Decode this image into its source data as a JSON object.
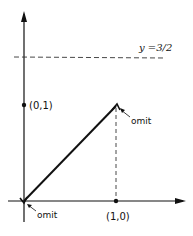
{
  "diagram": {
    "type": "function-graph",
    "axes": {
      "x_axis": {
        "origin_px": [
          24,
          201
        ],
        "end_px": [
          185,
          201
        ]
      },
      "y_axis": {
        "origin_px": [
          24,
          222
        ],
        "end_px": [
          24,
          12
        ]
      }
    },
    "points": [
      {
        "id": "p01",
        "label": "(0,1)",
        "px": [
          24,
          105
        ],
        "filled": true
      },
      {
        "id": "p10",
        "label": "(1,0)",
        "px": [
          116,
          201
        ],
        "filled": true
      }
    ],
    "segment": {
      "from_px": [
        24,
        201
      ],
      "to_px": [
        116,
        105
      ],
      "description": "line y = x from (0,0) to (1,1), endpoints omitted"
    },
    "dashed_horizontal": {
      "label": "y =3/2",
      "y_px": 57,
      "x_from_px": 14,
      "x_to_px": 166
    },
    "dashed_vertical": {
      "x_px": 116,
      "y_from_px": 107,
      "y_to_px": 199
    },
    "annotations": [
      {
        "id": "omit-top",
        "text": "omit",
        "arrow_to_px": [
          119,
          107
        ]
      },
      {
        "id": "omit-bottom",
        "text": "omit",
        "arrow_to_px": [
          26,
          203
        ]
      }
    ]
  }
}
